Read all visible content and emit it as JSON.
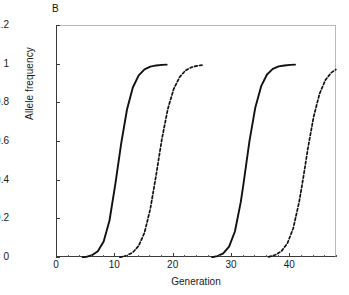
{
  "panel": {
    "label": "B"
  },
  "chart_data": {
    "type": "line",
    "title": "",
    "panel_label": "B",
    "xlabel": "Generation",
    "ylabel": "Allele frequency",
    "xlim": [
      0,
      48
    ],
    "ylim": [
      0,
      1.2
    ],
    "x_major_ticks": [
      0,
      10,
      20,
      30,
      40
    ],
    "x_minor_tick_step": 2,
    "y_ticks": [
      0,
      0.2,
      0.4,
      0.6,
      0.8,
      1,
      1.2
    ],
    "y_tick_labels": [
      "0",
      "0.2",
      "0.4",
      "0.6",
      "0.8",
      "1",
      "1.2"
    ],
    "grid": false,
    "legend": null,
    "series": [
      {
        "name": "sweep-1-solid",
        "style": "solid",
        "color": "#111111",
        "midpoint": 10.2,
        "steepness": 0.95,
        "x_start": 4.4,
        "x_end": 18.8,
        "plateau": 1.0,
        "points": [
          [
            4.4,
            0.003
          ],
          [
            5.0,
            0.006
          ],
          [
            6.0,
            0.014
          ],
          [
            7.0,
            0.035
          ],
          [
            8.0,
            0.085
          ],
          [
            9.0,
            0.194
          ],
          [
            10.0,
            0.382
          ],
          [
            10.5,
            0.487
          ],
          [
            11.0,
            0.592
          ],
          [
            12.0,
            0.768
          ],
          [
            13.0,
            0.882
          ],
          [
            14.0,
            0.945
          ],
          [
            15.0,
            0.976
          ],
          [
            16.0,
            0.99
          ],
          [
            17.0,
            0.996
          ],
          [
            18.0,
            0.999
          ],
          [
            18.8,
            1.0
          ]
        ]
      },
      {
        "name": "sweep-2-dashed",
        "style": "dashed",
        "color": "#111111",
        "midpoint": 17.0,
        "steepness": 0.82,
        "x_start": 10.8,
        "x_end": 25.2,
        "plateau": 1.0,
        "points": [
          [
            10.8,
            0.004
          ],
          [
            12.0,
            0.013
          ],
          [
            13.0,
            0.029
          ],
          [
            14.0,
            0.063
          ],
          [
            15.0,
            0.131
          ],
          [
            16.0,
            0.254
          ],
          [
            17.0,
            0.43
          ],
          [
            17.5,
            0.525
          ],
          [
            18.0,
            0.618
          ],
          [
            19.0,
            0.771
          ],
          [
            20.0,
            0.874
          ],
          [
            21.0,
            0.935
          ],
          [
            22.0,
            0.969
          ],
          [
            23.0,
            0.986
          ],
          [
            24.0,
            0.994
          ],
          [
            25.2,
            0.999
          ]
        ]
      },
      {
        "name": "sweep-3-solid",
        "style": "solid",
        "color": "#111111",
        "midpoint": 31.8,
        "steepness": 0.95,
        "x_start": 26.6,
        "x_end": 40.8,
        "plateau": 1.0,
        "points": [
          [
            26.6,
            0.004
          ],
          [
            27.5,
            0.01
          ],
          [
            28.5,
            0.024
          ],
          [
            29.5,
            0.059
          ],
          [
            30.5,
            0.137
          ],
          [
            31.5,
            0.289
          ],
          [
            32.0,
            0.39
          ],
          [
            32.5,
            0.498
          ],
          [
            33.0,
            0.606
          ],
          [
            34.0,
            0.779
          ],
          [
            35.0,
            0.889
          ],
          [
            36.0,
            0.949
          ],
          [
            37.0,
            0.978
          ],
          [
            38.0,
            0.991
          ],
          [
            39.0,
            0.996
          ],
          [
            40.0,
            0.999
          ],
          [
            40.8,
            1.0
          ]
        ]
      },
      {
        "name": "sweep-4-dashed",
        "style": "dashed",
        "color": "#111111",
        "midpoint": 42.3,
        "steepness": 0.8,
        "x_start": 36.3,
        "x_end": 47.8,
        "plateau": 0.985,
        "points": [
          [
            36.3,
            0.006
          ],
          [
            37.5,
            0.017
          ],
          [
            38.5,
            0.036
          ],
          [
            39.5,
            0.076
          ],
          [
            40.5,
            0.154
          ],
          [
            41.5,
            0.288
          ],
          [
            42.0,
            0.375
          ],
          [
            42.5,
            0.469
          ],
          [
            43.0,
            0.565
          ],
          [
            44.0,
            0.731
          ],
          [
            45.0,
            0.849
          ],
          [
            46.0,
            0.92
          ],
          [
            47.0,
            0.958
          ],
          [
            47.8,
            0.975
          ]
        ]
      }
    ]
  }
}
